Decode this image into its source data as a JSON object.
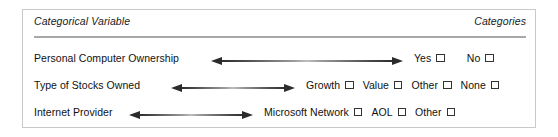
{
  "figure": {
    "header": {
      "left_label": "Categorical Variable",
      "right_label": "Categories"
    },
    "rows": [
      {
        "variable": "Personal Computer Ownership",
        "arrow_icon": "double-headed-arrow-icon",
        "options": [
          {
            "label": "Yes",
            "checked": false
          },
          {
            "label": "No",
            "checked": false
          }
        ]
      },
      {
        "variable": "Type of Stocks Owned",
        "arrow_icon": "double-headed-arrow-icon",
        "options": [
          {
            "label": "Growth",
            "checked": false
          },
          {
            "label": "Value",
            "checked": false
          },
          {
            "label": "Other",
            "checked": false
          },
          {
            "label": "None",
            "checked": false
          }
        ]
      },
      {
        "variable": "Internet Provider",
        "arrow_icon": "double-headed-arrow-icon",
        "options": [
          {
            "label": "Microsoft Network",
            "checked": false
          },
          {
            "label": "AOL",
            "checked": false
          },
          {
            "label": "Other",
            "checked": false
          }
        ]
      }
    ],
    "colors": {
      "border": "#c9c9c9",
      "rule": "#a8a8a8",
      "text": "#111111",
      "arrow": "#2b2b2b",
      "checkbox_border": "#333333",
      "background": "#ffffff"
    }
  }
}
